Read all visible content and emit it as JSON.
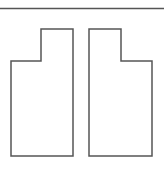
{
  "colors": {
    "background": "#ffffff",
    "stroke": "#555555"
  },
  "diagram": {
    "top_rule": {
      "y": 8.5,
      "x1": 0,
      "x2": 164
    },
    "shapes": [
      {
        "name": "left-stepped-shape",
        "points": "11,61 41,61 41,29 73,29 73,156 11,156"
      },
      {
        "name": "right-stepped-shape",
        "points": "89,29 121,29 121,61 152,61 152,156 89,156"
      }
    ]
  }
}
